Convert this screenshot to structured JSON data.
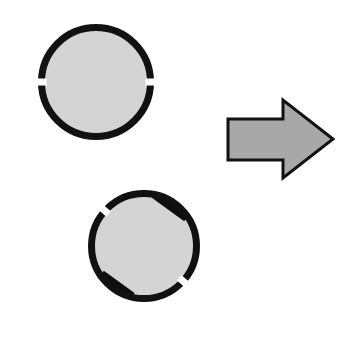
{
  "figure": {
    "title": "Mental rotation item: slotted disc shown in two orientations",
    "background_color": "#ffffff",
    "width": 340,
    "height": 354,
    "outline_color": "#111111",
    "disc_fill_color": "#d4d4d4",
    "tab_color": "#0d0d0d",
    "arrow_fill_color": "#a8a8a8",
    "arrow_outline_color": "#111111"
  },
  "objects": {
    "top_disc": {
      "label": "Disc in original orientation",
      "center_x": 96,
      "center_y": 82,
      "radius": 58,
      "ring_width": 7,
      "rotation_degrees": 0,
      "tabs": [
        {
          "name": "top-tab",
          "position": "top",
          "angle_degrees": 78,
          "width": 23,
          "length": 36
        },
        {
          "name": "bottom-tab",
          "position": "bottom",
          "angle_degrees": 258,
          "width": 23,
          "length": 34
        }
      ],
      "ring_gaps": [
        {
          "name": "left-gap",
          "angle_degrees": 180
        },
        {
          "name": "right-gap",
          "angle_degrees": 0
        }
      ]
    },
    "bottom_disc": {
      "label": "Disc rotated clockwise",
      "center_x": 144,
      "center_y": 246,
      "radius": 56,
      "ring_width": 7,
      "rotation_degrees": 42,
      "tabs": [
        {
          "name": "upper-right-tab",
          "position": "upper-right",
          "angle_degrees": 36,
          "width": 23,
          "length": 36
        },
        {
          "name": "lower-left-tab",
          "position": "lower-left",
          "angle_degrees": 216,
          "width": 23,
          "length": 34
        }
      ],
      "ring_gaps": [
        {
          "name": "upper-left-gap",
          "angle_degrees": 138
        },
        {
          "name": "lower-right-gap",
          "angle_degrees": -42
        }
      ]
    },
    "arrow": {
      "label": "Transformation arrow pointing right",
      "direction": "right",
      "shaft_left_x": 228,
      "shaft_top_y": 119,
      "shaft_bottom_y": 160,
      "barb_x": 283,
      "barb_top_y": 100,
      "barb_bottom_y": 178,
      "tip_x": 333,
      "tip_y": 139
    }
  }
}
